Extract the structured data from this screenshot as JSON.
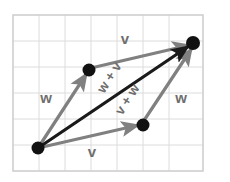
{
  "figure": {
    "canvas": {
      "width": 230,
      "height": 182,
      "background": "#ffffff"
    },
    "grid": {
      "left": 13,
      "top": 15,
      "right": 203,
      "bottom": 171,
      "cell": 26,
      "columns": 7,
      "rows": 6,
      "line_color": "#d9d9d9",
      "frame_color": "#cfcfcf",
      "visible": true
    },
    "colors": {
      "vector_gray": "#808080",
      "resultant_black": "#1a1a1a",
      "dot_black": "#111111",
      "label_gray": "#6e6e6e",
      "grid": "#d9d9d9",
      "background": "#ffffff"
    },
    "points": [
      {
        "name": "origin",
        "x": 38,
        "y": 148
      },
      {
        "name": "head-of-w",
        "x": 89,
        "y": 70
      },
      {
        "name": "head-of-v",
        "x": 143,
        "y": 125
      },
      {
        "name": "resultant-head",
        "x": 193,
        "y": 43
      }
    ],
    "vectors": [
      {
        "name": "w-left",
        "label": "w",
        "from": "origin",
        "to": "head-of-w",
        "color": "#808080",
        "style": "solid",
        "arrow": true
      },
      {
        "name": "v-top",
        "label": "v",
        "from": "head-of-w",
        "to": "resultant-head",
        "color": "#808080",
        "style": "solid",
        "arrow": true
      },
      {
        "name": "v-bottom",
        "label": "v",
        "from": "origin",
        "to": "head-of-v",
        "color": "#808080",
        "style": "solid",
        "arrow": true
      },
      {
        "name": "w-right",
        "label": "w",
        "from": "head-of-v",
        "to": "resultant-head",
        "color": "#808080",
        "style": "solid",
        "arrow": true
      },
      {
        "name": "resultant",
        "label": "w + v",
        "from": "origin",
        "to": "resultant-head",
        "color": "#1a1a1a",
        "style": "solid",
        "arrow": true
      }
    ],
    "labels": [
      {
        "name": "label-v-top",
        "text": "v",
        "x": 125,
        "y": 40,
        "rotation": 0,
        "size": 15
      },
      {
        "name": "label-w-left",
        "text": "w",
        "x": 46,
        "y": 99,
        "rotation": 0,
        "size": 15
      },
      {
        "name": "label-w-right",
        "text": "w",
        "x": 181,
        "y": 99,
        "rotation": 0,
        "size": 15
      },
      {
        "name": "label-v-bottom",
        "text": "v",
        "x": 92,
        "y": 153,
        "rotation": 0,
        "size": 15
      },
      {
        "name": "label-w-plus-v",
        "text": "w + v",
        "x": 110,
        "y": 78,
        "rotation": -57,
        "size": 13.5
      },
      {
        "name": "label-v-plus-w",
        "text": "v + w",
        "x": 128,
        "y": 100,
        "rotation": -57,
        "size": 13.5
      }
    ],
    "dot_radius": 6
  }
}
